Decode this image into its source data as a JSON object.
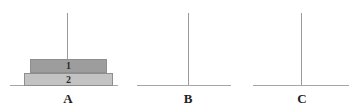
{
  "figure": {
    "background_color": "#ffffff",
    "width": 364,
    "height": 112,
    "line_color": "#9a9a9a",
    "baseline_color": "#a6a6a6"
  },
  "chart_data": {
    "type": "bar",
    "title": "",
    "xlabel": "",
    "ylabel": "",
    "grid": false,
    "legend": "none",
    "categories": [
      "A",
      "B",
      "C"
    ],
    "series": [
      {
        "name": "1",
        "values": [
          1,
          0,
          0
        ]
      },
      {
        "name": "2",
        "values": [
          1,
          0,
          0
        ]
      }
    ]
  },
  "groups": [
    {
      "id": "group-a",
      "label": "A",
      "label_x": 61,
      "label_y": 92,
      "label_width": 14,
      "stem": {
        "x": 67,
        "y": 13,
        "height": 72
      },
      "baseline": {
        "x": 10,
        "y": 85,
        "width": 108
      },
      "bars": [
        {
          "id": "bar-1",
          "label": "1",
          "x": 30,
          "y": 59,
          "width": 77,
          "height": 14,
          "fill": "#9d9d9d",
          "stroke": "#8e8e8e"
        },
        {
          "id": "bar-2",
          "label": "2",
          "x": 24,
          "y": 73,
          "width": 89,
          "height": 13,
          "fill": "#c3c3c3",
          "stroke": "#8e8e8e"
        }
      ]
    },
    {
      "id": "group-b",
      "label": "B",
      "label_x": 181,
      "label_y": 92,
      "label_width": 14,
      "stem": {
        "x": 188,
        "y": 13,
        "height": 72
      },
      "baseline": {
        "x": 137,
        "y": 85,
        "width": 94
      },
      "bars": []
    },
    {
      "id": "group-c",
      "label": "C",
      "label_x": 295,
      "label_y": 92,
      "label_width": 14,
      "stem": {
        "x": 301,
        "y": 13,
        "height": 72
      },
      "baseline": {
        "x": 253,
        "y": 85,
        "width": 96
      },
      "bars": []
    }
  ]
}
